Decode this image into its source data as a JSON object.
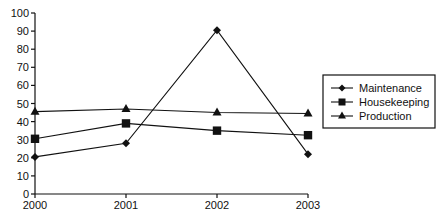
{
  "chart_data": {
    "type": "line",
    "title": "",
    "xlabel": "",
    "ylabel": "",
    "categories": [
      "2000",
      "2001",
      "2002",
      "2003"
    ],
    "ylim": [
      0,
      100
    ],
    "yticks": [
      0,
      10,
      20,
      30,
      40,
      50,
      60,
      70,
      80,
      90,
      100
    ],
    "grid": false,
    "legend_position": "right",
    "series": [
      {
        "name": "Maintenance",
        "marker": "diamond",
        "values": [
          20.5,
          28,
          90.5,
          22
        ]
      },
      {
        "name": "Housekeeping",
        "marker": "square",
        "values": [
          30.5,
          39,
          35,
          32.5
        ]
      },
      {
        "name": "Production",
        "marker": "triangle",
        "values": [
          45.5,
          47,
          45,
          44.5
        ]
      }
    ],
    "colors": {
      "line": "#111111",
      "background": "#ffffff"
    }
  }
}
